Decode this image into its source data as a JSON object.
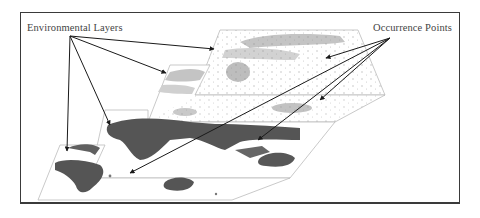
{
  "diagram": {
    "labels": {
      "environmental_layers": "Environmental Layers",
      "occurrence_points": "Occurrence Points"
    },
    "layers": [
      {
        "id": "layer-1",
        "description": "Environmental raster layer (light grey, back-most)",
        "tone": "#c9c9c9"
      },
      {
        "id": "layer-2",
        "description": "Environmental raster layer (light grey)",
        "tone": "#bdbdbd"
      },
      {
        "id": "layer-3",
        "description": "World map layer (dark landmass)",
        "tone": "#555555"
      },
      {
        "id": "layer-4",
        "description": "World map layer (dark landmass, front-most)",
        "tone": "#5a5a5a"
      }
    ],
    "arrows": {
      "environmental_layers_targets": 4,
      "occurrence_points_targets": 4
    },
    "colors": {
      "frame": "#3a3a3a",
      "arrow": "#1a1a1a",
      "layer_edge": "#bbbbbb",
      "text": "#444444"
    }
  }
}
